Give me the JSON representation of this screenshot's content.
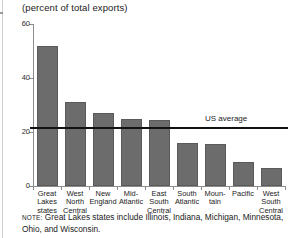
{
  "figure": {
    "subtitle": "(percent of total exports)",
    "note_prefix": "NOTE:",
    "note_text": " Great Lakes states include Illinois, Indiana, Michigan, Minnesota, Ohio, and Wisconsin.",
    "bar_color": "#6c6c6c",
    "bar_edge_color": "#5a5a5a",
    "axis_color": "#8c8c8c",
    "avg_line_color": "#111111"
  },
  "chart_data": {
    "type": "bar",
    "title": "",
    "subtitle": "(percent of total exports)",
    "xlabel": "",
    "ylabel": "",
    "ylim": [
      0,
      60
    ],
    "yticks": [
      0,
      20,
      40,
      60
    ],
    "ytick_labels": [
      "0",
      "20",
      "40",
      "60"
    ],
    "grid": false,
    "legend": "none",
    "categories": [
      "Great Lakes states",
      "West North Central",
      "New England",
      "Mid-Atlantic",
      "East South Central",
      "South Atlantic",
      "Mountain",
      "Pacific",
      "West South Central"
    ],
    "category_lines": [
      [
        "Great",
        "Lakes",
        "states"
      ],
      [
        "West",
        "North",
        "Central"
      ],
      [
        "New",
        "England"
      ],
      [
        "Mid-",
        "Atlantic"
      ],
      [
        "East",
        "South",
        "Central"
      ],
      [
        "South",
        "Atlantic"
      ],
      [
        "Moun-",
        "tain"
      ],
      [
        "Pacific"
      ],
      [
        "West",
        "South",
        "Central"
      ]
    ],
    "values": [
      52,
      31,
      27,
      25,
      24.5,
      16,
      15.5,
      9,
      6.5
    ],
    "annotations": [
      {
        "name": "us-average",
        "label": "US average",
        "type": "hline",
        "value": 21.5
      }
    ]
  }
}
